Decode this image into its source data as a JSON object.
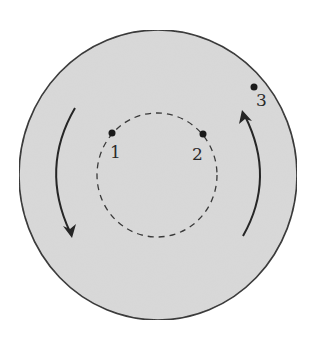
{
  "diagram": {
    "colors": {
      "disk_fill": "#d9d9d9",
      "disk_stroke": "#2e2e2e",
      "dashed_stroke": "#3a3a3a",
      "point": "#1a1a1a",
      "arrow": "#262626",
      "background": "#ffffff"
    },
    "outer_disk": {
      "cx": 158,
      "cy": 175,
      "rx": 139,
      "ry": 145
    },
    "inner_circle": {
      "cx": 157,
      "cy": 175,
      "rx": 60,
      "ry": 62,
      "style": "dashed"
    },
    "points": [
      {
        "id": "1",
        "label": "1",
        "x": 112,
        "y": 133,
        "label_x": 110,
        "label_y": 158
      },
      {
        "id": "2",
        "label": "2",
        "x": 203,
        "y": 134,
        "label_x": 192,
        "label_y": 160
      },
      {
        "id": "3",
        "label": "3",
        "x": 254,
        "y": 87,
        "label_x": 256,
        "label_y": 106
      }
    ],
    "arrows": [
      {
        "id": "left-arrow",
        "direction": "down",
        "rotation": "counterclockwise-side"
      },
      {
        "id": "right-arrow",
        "direction": "up",
        "rotation": "counterclockwise-side"
      }
    ]
  }
}
